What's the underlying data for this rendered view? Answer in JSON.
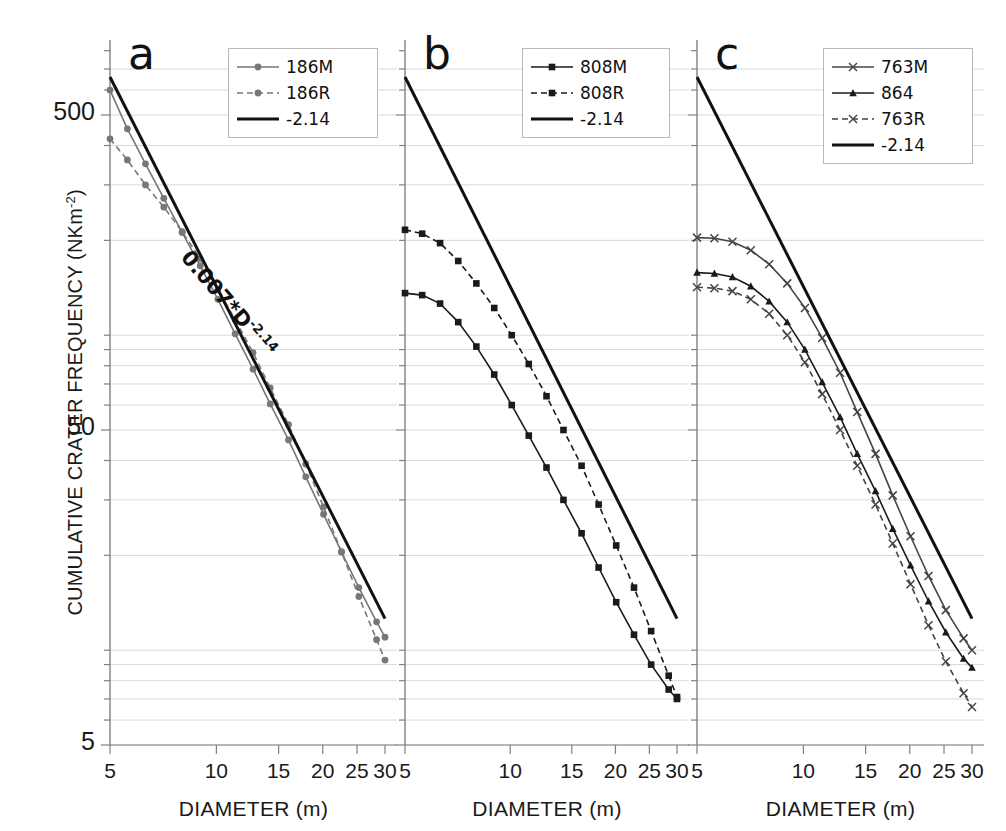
{
  "figure": {
    "ylabel_text": "CUMULATIVE CRATER FREQUENCY (NKm",
    "ylabel_exp": "-2",
    "ylabel_close": ")",
    "xlabel": "DIAMETER (m)",
    "background": "#ffffff",
    "grid_color": "#d9d9d9",
    "axis_color": "#808080"
  },
  "chart_data": {
    "type": "line",
    "title": "",
    "xlabel": "DIAMETER (m)",
    "ylabel": "CUMULATIVE CRATER FREQUENCY (NKm-2)",
    "xscale": "log",
    "yscale": "log",
    "xlim": [
      5,
      30
    ],
    "ylim": [
      5,
      900
    ],
    "xticks": [
      5,
      10,
      15,
      20,
      25,
      30
    ],
    "xtick_labels": [
      "5",
      "10",
      "15",
      "20",
      "25",
      "30"
    ],
    "yticks": [
      5,
      50,
      500
    ],
    "ytick_labels": [
      "5",
      "50",
      "500"
    ],
    "grid": true,
    "legend_position": "top-right",
    "panels": [
      {
        "letter": "a",
        "annotation": "0.007*D",
        "annotation_exp": "-2.14",
        "legend": [
          {
            "label": "186M",
            "marker": "circle",
            "dash": "solid",
            "color": "#777777"
          },
          {
            "label": "186R",
            "marker": "circle",
            "dash": "dashed",
            "color": "#777777"
          },
          {
            "label": "-2.14",
            "marker": "none",
            "dash": "solid",
            "color": "#111111"
          }
        ],
        "series": [
          {
            "name": "186M",
            "x": [
              5.0,
              5.6,
              6.3,
              7.1,
              8.0,
              9.0,
              10.1,
              11.3,
              12.7,
              14.2,
              16.0,
              17.9,
              20.1,
              22.6,
              25.3,
              28.4,
              30.0
            ],
            "y": [
              600,
              452,
              350,
              272,
              212,
              166,
              130,
              101,
              78,
              60.5,
              46.5,
              35.5,
              27.0,
              20.5,
              15.8,
              12.3,
              11.0
            ]
          },
          {
            "name": "186R",
            "x": [
              5.0,
              5.6,
              6.3,
              7.1,
              8.0,
              9.0,
              10.1,
              11.3,
              12.7,
              14.2,
              16.0,
              17.9,
              20.1,
              22.6,
              25.3,
              28.4,
              30.0
            ],
            "y": [
              420,
              360,
              300,
              255,
              213,
              175,
              140,
              112,
              88,
              68,
              52,
              39,
              28.5,
              20.5,
              14.8,
              10.8,
              9.3
            ]
          },
          {
            "name": "-2.14",
            "x": [
              5.0,
              30.0
            ],
            "y": [
              660,
              12.6
            ]
          }
        ]
      },
      {
        "letter": "b",
        "legend": [
          {
            "label": "808M",
            "marker": "square",
            "dash": "solid",
            "color": "#1a1a1a"
          },
          {
            "label": "808R",
            "marker": "square",
            "dash": "dashed",
            "color": "#1a1a1a"
          },
          {
            "label": "-2.14",
            "marker": "none",
            "dash": "solid",
            "color": "#111111"
          }
        ],
        "series": [
          {
            "name": "808M",
            "x": [
              5.0,
              5.6,
              6.3,
              7.1,
              8.0,
              9.0,
              10.1,
              11.3,
              12.7,
              14.2,
              16.0,
              17.9,
              20.1,
              22.6,
              25.3,
              28.4,
              30.0
            ],
            "y": [
              136,
              134,
              126,
              110,
              92,
              75,
              60,
              48,
              38,
              30,
              23.5,
              18.3,
              14.2,
              11.2,
              9.0,
              7.5,
              7.0
            ]
          },
          {
            "name": "808R",
            "x": [
              5.0,
              5.6,
              6.3,
              7.1,
              8.0,
              9.0,
              10.1,
              11.3,
              12.7,
              14.2,
              16.0,
              17.9,
              20.1,
              22.6,
              25.3,
              28.4,
              30.0
            ],
            "y": [
              216,
              210,
              196,
              172,
              146,
              122,
              100,
              81,
              64,
              50,
              38.5,
              29.0,
              21.5,
              15.8,
              11.5,
              8.3,
              7.1
            ]
          },
          {
            "name": "-2.14",
            "x": [
              5.0,
              30.0
            ],
            "y": [
              660,
              12.6
            ]
          }
        ]
      },
      {
        "letter": "c",
        "legend": [
          {
            "label": "763M",
            "marker": "x",
            "dash": "solid",
            "color": "#444444"
          },
          {
            "label": "864",
            "marker": "triangle",
            "dash": "solid",
            "color": "#1a1a1a"
          },
          {
            "label": "763R",
            "marker": "x",
            "dash": "dashed",
            "color": "#444444"
          },
          {
            "label": "-2.14",
            "marker": "none",
            "dash": "solid",
            "color": "#111111"
          }
        ],
        "series": [
          {
            "name": "763M",
            "x": [
              5.0,
              5.6,
              6.3,
              7.1,
              8.0,
              9.0,
              10.1,
              11.3,
              12.7,
              14.2,
              16.0,
              17.9,
              20.1,
              22.6,
              25.3,
              28.4,
              30.0
            ],
            "y": [
              204,
              203,
              198,
              186,
              168,
              146,
              122,
              98,
              76,
              57,
              42,
              31,
              23,
              17.2,
              13.4,
              10.9,
              10.0
            ]
          },
          {
            "name": "864",
            "x": [
              5.0,
              5.6,
              6.3,
              7.1,
              8.0,
              9.0,
              10.1,
              11.3,
              12.7,
              14.2,
              16.0,
              17.9,
              20.1,
              22.6,
              25.3,
              28.4,
              30.0
            ],
            "y": [
              158,
              157,
              153,
              143,
              128,
              110,
              90,
              71,
              55,
              42,
              32,
              24.3,
              18.6,
              14.3,
              11.4,
              9.4,
              8.8
            ]
          },
          {
            "name": "763R",
            "x": [
              5.0,
              5.6,
              6.3,
              7.1,
              8.0,
              9.0,
              10.1,
              11.3,
              12.7,
              14.2,
              16.0,
              17.9,
              20.1,
              22.6,
              25.3,
              28.4,
              30.0
            ],
            "y": [
              142,
              141,
              138,
              130,
              117,
              100,
              82,
              65,
              50,
              38.5,
              29,
              21.8,
              16.2,
              12.0,
              9.2,
              7.3,
              6.6
            ]
          },
          {
            "name": "-2.14",
            "x": [
              5.0,
              30.0
            ],
            "y": [
              660,
              12.6
            ]
          }
        ]
      }
    ]
  }
}
